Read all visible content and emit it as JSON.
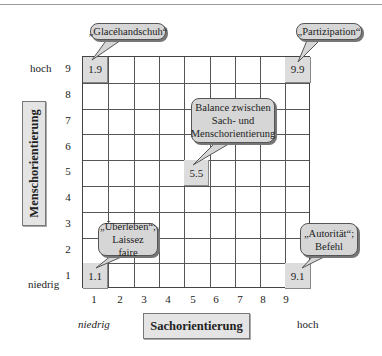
{
  "diagram": {
    "type": "grid-matrix",
    "x_axis": {
      "title": "Sachorientierung",
      "low_label": "niedrig",
      "high_label": "hoch",
      "ticks": [
        "1",
        "2",
        "3",
        "4",
        "5",
        "6",
        "7",
        "8",
        "9"
      ]
    },
    "y_axis": {
      "title": "Menschorientierung",
      "low_label": "niedrig",
      "high_label": "hoch",
      "ticks": [
        "9",
        "8",
        "7",
        "6",
        "5",
        "4",
        "3",
        "2",
        "1"
      ]
    },
    "cells": [
      {
        "label": "1.9",
        "col": 1,
        "row": 9
      },
      {
        "label": "9.9",
        "col": 9,
        "row": 9
      },
      {
        "label": "5.5",
        "col": 5,
        "row": 5
      },
      {
        "label": "1.1",
        "col": 1,
        "row": 1
      },
      {
        "label": "9.1",
        "col": 9,
        "row": 1
      }
    ],
    "callouts": {
      "glace": "„Glacéhandschuh“",
      "partizipation": "„Partizipation“",
      "balance_1": "Balance zwischen",
      "balance_2": "Sach- und",
      "balance_3": "Menschorientierung",
      "ueberleben_1": "„Überleben“;",
      "ueberleben_2": "Laissez faire",
      "autoritaer_1": "„Autorität“;",
      "autoritaer_2": "Befehl"
    }
  }
}
